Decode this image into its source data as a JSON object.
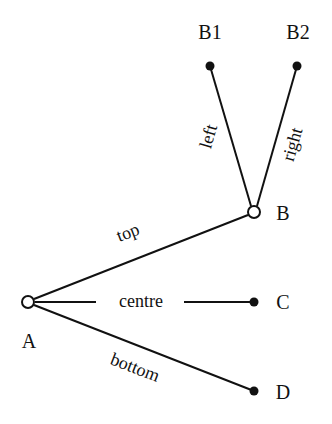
{
  "diagram": {
    "type": "tree",
    "colors": {
      "ink": "#111111",
      "background": "#ffffff"
    },
    "nodes": [
      {
        "id": "A",
        "label": "A",
        "style": "open"
      },
      {
        "id": "B",
        "label": "B",
        "style": "open"
      },
      {
        "id": "C",
        "label": "C",
        "style": "filled"
      },
      {
        "id": "D",
        "label": "D",
        "style": "filled"
      },
      {
        "id": "B1",
        "label": "B1",
        "style": "filled"
      },
      {
        "id": "B2",
        "label": "B2",
        "style": "filled"
      }
    ],
    "edges": [
      {
        "from": "A",
        "to": "B",
        "label": "top"
      },
      {
        "from": "A",
        "to": "C",
        "label": "centre"
      },
      {
        "from": "A",
        "to": "D",
        "label": "bottom"
      },
      {
        "from": "B",
        "to": "B1",
        "label": "left"
      },
      {
        "from": "B",
        "to": "B2",
        "label": "right"
      }
    ]
  },
  "labels": {
    "A": "A",
    "B": "B",
    "C": "C",
    "D": "D",
    "B1": "B1",
    "B2": "B2",
    "top": "top",
    "centre": "centre",
    "bottom": "bottom",
    "left": "left",
    "right": "right"
  }
}
